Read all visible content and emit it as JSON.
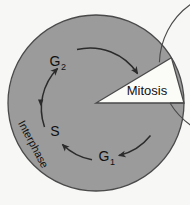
{
  "diagram": {
    "phases": {
      "mitosis": "Mitosis",
      "interphase": "Interphase",
      "g2_base": "G",
      "g2_sub": "2",
      "s": "S",
      "g1_base": "G",
      "g1_sub": "1"
    },
    "colors": {
      "background": "#f7f7f6",
      "interphase_fill": "#9b9b9b",
      "mitosis_fill": "#fbfbf8",
      "outline": "#4a4a4a",
      "arrow": "#2b2b2b",
      "text": "#111111"
    },
    "geometry": {
      "center_x": 96,
      "center_y": 103,
      "outer_radius": 88,
      "ring_radius": 74,
      "arrow_radius": 57,
      "mitosis_start_deg": 0,
      "mitosis_end_deg": 31
    },
    "icons": {
      "arrow_to_mitosis": "arrowhead-icon",
      "arrow_to_g2": "arrowhead-icon",
      "arrow_to_s": "arrowhead-icon",
      "arrow_to_g1": "arrowhead-icon"
    }
  }
}
